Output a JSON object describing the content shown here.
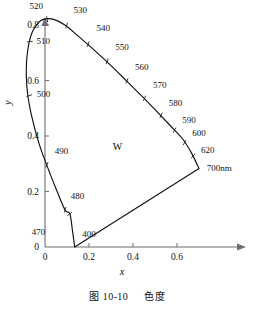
{
  "figure": {
    "caption_prefix": "图",
    "caption_number": "10-10",
    "caption_title": "色度"
  },
  "axes": {
    "xlabel": "x",
    "ylabel": "y",
    "x_ticks": [
      "0",
      "0.2",
      "0.4",
      "0.6"
    ],
    "y_ticks": [
      "0",
      "0.2",
      "0.4",
      "0.6",
      "0.8"
    ],
    "white_point_label": "W"
  },
  "chart_data": {
    "type": "line",
    "title": "图 10-10 色度",
    "xlabel": "x",
    "ylabel": "y",
    "xlim": [
      -0.12,
      0.78
    ],
    "ylim": [
      0,
      0.88
    ],
    "x_ticks": [
      0,
      0.2,
      0.4,
      0.6
    ],
    "y_ticks": [
      0,
      0.2,
      0.4,
      0.6,
      0.8
    ],
    "grid": false,
    "legend": null,
    "annotations": [
      {
        "text": "W",
        "x": 0.33,
        "y": 0.35
      }
    ],
    "series": [
      {
        "name": "spectral locus",
        "points": [
          [
            0.135,
            0.0
          ],
          [
            0.125,
            0.058
          ],
          [
            0.113,
            0.12
          ],
          [
            0.091,
            0.133
          ],
          [
            0.05,
            0.21
          ],
          [
            0.008,
            0.295
          ],
          [
            -0.03,
            0.38
          ],
          [
            -0.06,
            0.47
          ],
          [
            -0.078,
            0.545
          ],
          [
            -0.085,
            0.62
          ],
          [
            -0.08,
            0.7
          ],
          [
            -0.06,
            0.77
          ],
          [
            -0.02,
            0.815
          ],
          [
            0.03,
            0.822
          ],
          [
            0.09,
            0.8
          ],
          [
            0.155,
            0.757
          ],
          [
            0.23,
            0.705
          ],
          [
            0.305,
            0.65
          ],
          [
            0.375,
            0.595
          ],
          [
            0.445,
            0.54
          ],
          [
            0.51,
            0.487
          ],
          [
            0.57,
            0.437
          ],
          [
            0.625,
            0.39
          ],
          [
            0.665,
            0.34
          ],
          [
            0.7,
            0.283
          ]
        ]
      },
      {
        "name": "purple line",
        "points": [
          [
            0.135,
            0.0
          ],
          [
            0.7,
            0.283
          ]
        ]
      }
    ],
    "wavelength_markers": [
      {
        "label": "400",
        "x": 0.135,
        "y": 0.0,
        "lx": 0.16,
        "ly": 0.048
      },
      {
        "label": "470",
        "x": 0.113,
        "y": 0.12,
        "lx": 0.01,
        "ly": 0.055
      },
      {
        "label": "480",
        "x": 0.091,
        "y": 0.133,
        "lx": 0.108,
        "ly": 0.185
      },
      {
        "label": "490",
        "x": 0.008,
        "y": 0.295,
        "lx": 0.035,
        "ly": 0.345
      },
      {
        "label": "500",
        "x": -0.073,
        "y": 0.545,
        "lx": -0.047,
        "ly": 0.552
      },
      {
        "label": "510",
        "x": -0.07,
        "y": 0.74,
        "lx": -0.048,
        "ly": 0.742
      },
      {
        "label": "520",
        "x": 0.01,
        "y": 0.82,
        "lx": 0.0,
        "ly": 0.87
      },
      {
        "label": "530",
        "x": 0.098,
        "y": 0.797,
        "lx": 0.12,
        "ly": 0.855
      },
      {
        "label": "540",
        "x": 0.196,
        "y": 0.73,
        "lx": 0.225,
        "ly": 0.79
      },
      {
        "label": "550",
        "x": 0.282,
        "y": 0.668,
        "lx": 0.31,
        "ly": 0.723
      },
      {
        "label": "560",
        "x": 0.372,
        "y": 0.598,
        "lx": 0.4,
        "ly": 0.65
      },
      {
        "label": "570",
        "x": 0.452,
        "y": 0.535,
        "lx": 0.482,
        "ly": 0.585
      },
      {
        "label": "580",
        "x": 0.527,
        "y": 0.474,
        "lx": 0.553,
        "ly": 0.52
      },
      {
        "label": "590",
        "x": 0.588,
        "y": 0.42,
        "lx": 0.615,
        "ly": 0.46
      },
      {
        "label": "600",
        "x": 0.634,
        "y": 0.375,
        "lx": 0.66,
        "ly": 0.41
      },
      {
        "label": "620",
        "x": 0.672,
        "y": 0.327,
        "lx": 0.7,
        "ly": 0.352
      },
      {
        "label": "700nm",
        "x": 0.7,
        "y": 0.283,
        "lx": 0.726,
        "ly": 0.285
      }
    ]
  }
}
